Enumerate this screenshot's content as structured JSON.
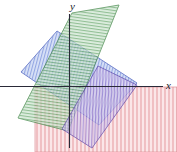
{
  "figure": {
    "title": "",
    "width": 177,
    "height": 152,
    "background": "#ffffff"
  },
  "axes": {
    "x_label": "x",
    "y_label": "y",
    "axis_color": "#2a2a38",
    "origin": {
      "x": 69,
      "y": 86
    },
    "x_axis": {
      "x1": 0,
      "y1": 86,
      "x2": 163,
      "y2": 86
    },
    "y_axis": {
      "x1": 69,
      "y1": 14,
      "x2": 69,
      "y2": 148
    }
  },
  "chart_data": {
    "type": "diagram",
    "subtype": "half-plane-intersection",
    "title": "",
    "xlabel": "x",
    "ylabel": "y",
    "grid": false,
    "legend": "none",
    "regions": [
      {
        "name": "blue-region",
        "color": "#4a63c8",
        "fill": "#8fa8e8",
        "hatch": "vertical-tilted",
        "hatch_angle_deg": 75,
        "opacity": 0.45,
        "polygon": [
          [
            21,
            72
          ],
          [
            57,
            31
          ],
          [
            137,
            83
          ],
          [
            99,
            125
          ]
        ]
      },
      {
        "name": "green-region",
        "color": "#3f8c44",
        "fill": "#8fc79a",
        "hatch": "horizontal-tilted",
        "hatch_angle_deg": 8,
        "opacity": 0.45,
        "polygon": [
          [
            72,
            13
          ],
          [
            119,
            5
          ],
          [
            68,
            131
          ],
          [
            18,
            118
          ]
        ]
      },
      {
        "name": "purple-region",
        "color": "#6a4fb5",
        "fill": "#b9a9e0",
        "hatch": "vertical",
        "hatch_angle_deg": 90,
        "opacity": 0.42,
        "polygon": [
          [
            98,
            66
          ],
          [
            137,
            85
          ],
          [
            92,
            148
          ],
          [
            62,
            129
          ]
        ]
      },
      {
        "name": "red-region",
        "color": "#c94d55",
        "fill": "#f0a9ae",
        "hatch": "vertical",
        "hatch_angle_deg": 90,
        "opacity": 0.4,
        "polygon": [
          [
            35,
            87
          ],
          [
            177,
            87
          ],
          [
            177,
            152
          ],
          [
            35,
            152
          ]
        ]
      }
    ]
  }
}
